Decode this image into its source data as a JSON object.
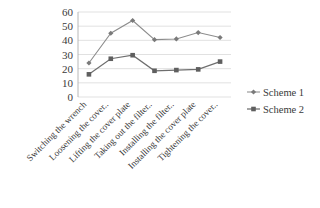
{
  "chart_data": {
    "type": "line",
    "title": "",
    "xlabel": "",
    "ylabel": "",
    "ylim": [
      0,
      60
    ],
    "yticks": [
      0,
      10,
      20,
      30,
      40,
      50,
      60
    ],
    "grid": true,
    "legend_position": "right",
    "categories": [
      "Switching the wrench",
      "Loosening the cover..",
      "Lifting the cover plate",
      "Taking out the filter..",
      "Installing the filter..",
      "Installing the cover plate",
      "Tightening the cover.."
    ],
    "series": [
      {
        "name": "Scheme 1",
        "color": "#8c8c8c",
        "marker": "diamond",
        "values": [
          24,
          45,
          54,
          40.5,
          41,
          45.5,
          42
        ]
      },
      {
        "name": "Scheme 2",
        "color": "#6e6e6e",
        "marker": "square",
        "values": [
          16,
          27,
          29.5,
          18.5,
          19,
          19.5,
          25
        ]
      }
    ]
  },
  "legend": {
    "items": [
      {
        "label": "Scheme 1"
      },
      {
        "label": "Scheme 2"
      }
    ]
  },
  "axis": {
    "y_tick_labels": [
      "60",
      "50",
      "40",
      "30",
      "20",
      "10",
      "0"
    ]
  }
}
